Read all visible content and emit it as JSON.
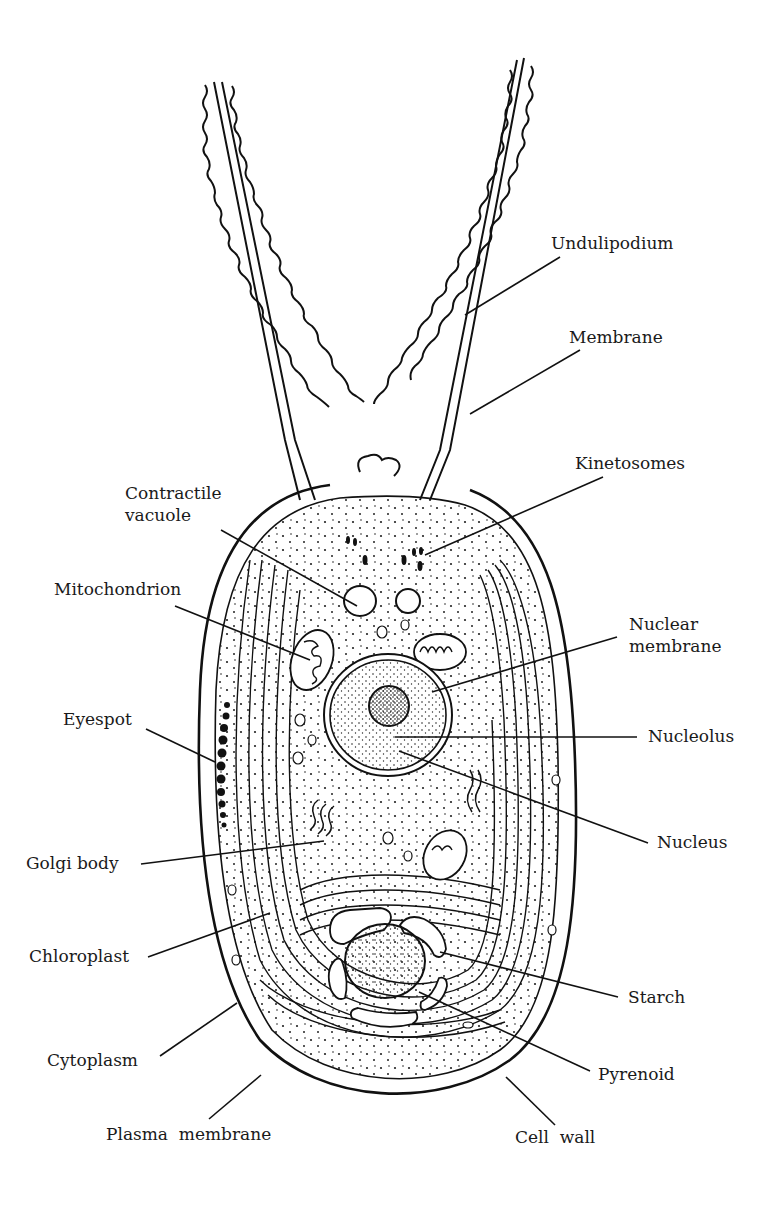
{
  "diagram": {
    "stroke_color": "#111111",
    "background": "#ffffff",
    "labels": {
      "undulipodium": "Undulipodium",
      "membrane": "Membrane",
      "kinetosomes": "Kinetosomes",
      "contractile_vacuole": "Contractile\nvacuole",
      "mitochondrion": "Mitochondrion",
      "nuclear_membrane": "Nuclear\nmembrane",
      "nucleolus": "Nucleolus",
      "eyespot": "Eyespot",
      "nucleus": "Nucleus",
      "golgi_body": "Golgi body",
      "chloroplast": "Chloroplast",
      "starch": "Starch",
      "cytoplasm": "Cytoplasm",
      "pyrenoid": "Pyrenoid",
      "plasma_membrane": "Plasma  membrane",
      "cell_wall": "Cell  wall"
    }
  }
}
